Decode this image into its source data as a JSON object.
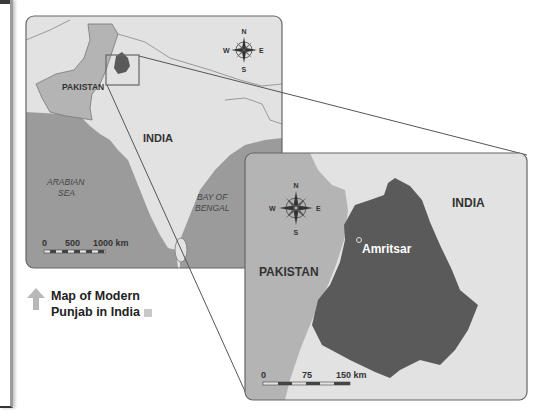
{
  "main_map": {
    "labels": {
      "pakistan": "PAKISTAN",
      "india": "INDIA",
      "arabian_sea_line1": "ARABIAN",
      "arabian_sea_line2": "SEA",
      "bay_line1": "BAY OF",
      "bay_line2": "BENGAL"
    },
    "compass": {
      "n": "N",
      "s": "S",
      "e": "E",
      "w": "W"
    },
    "scale": {
      "tick0": "0",
      "tick1": "500",
      "tick2": "1000 km"
    }
  },
  "inset_map": {
    "labels": {
      "pakistan": "PAKISTAN",
      "india": "INDIA",
      "city": "Amritsar"
    },
    "compass": {
      "n": "N",
      "s": "S",
      "e": "E",
      "w": "W"
    },
    "scale": {
      "tick0": "0",
      "tick1": "75",
      "tick2": "150 km"
    }
  },
  "caption": {
    "line1": "Map of Modern",
    "line2": "Punjab in India"
  },
  "colors": {
    "water": "#9b9b9b",
    "land_light": "#e2e2e2",
    "land_pakistan": "#b4b4b4",
    "punjab": "#5a5a5a",
    "border": "#6a6a6a"
  }
}
